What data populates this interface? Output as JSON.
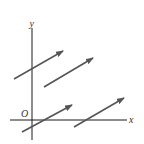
{
  "diagram": {
    "type": "vector-field",
    "colors": {
      "axis": "#1a1a1a",
      "arrow": "#555555",
      "label": "#333333",
      "background": "#ffffff"
    },
    "axes": {
      "x_label": "x",
      "y_label": "y",
      "origin_label": "O"
    },
    "arrows": [
      {
        "id": 1,
        "x1": 14,
        "y1": 79,
        "x2": 63,
        "y2": 51
      },
      {
        "id": 2,
        "x1": 44,
        "y1": 87,
        "x2": 93,
        "y2": 58
      },
      {
        "id": 3,
        "x1": 22,
        "y1": 132,
        "x2": 72,
        "y2": 105
      },
      {
        "id": 4,
        "x1": 74,
        "y1": 127,
        "x2": 124,
        "y2": 98
      }
    ]
  }
}
